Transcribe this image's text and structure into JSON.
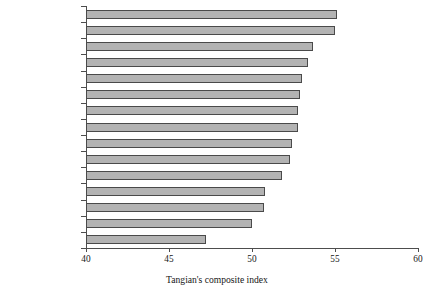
{
  "chart_data": {
    "type": "bar",
    "orientation": "horizontal",
    "title": "",
    "xlabel": "Tangian's composite index",
    "ylabel": "",
    "xlim": [
      40,
      60
    ],
    "xticks": [
      40,
      45,
      50,
      55,
      60
    ],
    "grid": false,
    "legend": null,
    "bar_color": "#b3b3b3",
    "bar_edge_color": "#4a4a4a",
    "categories": [
      "Netherlands",
      "Denmark",
      "Austria",
      "Sweden",
      "Germany",
      "Ireland",
      "Belgium",
      "Luxembourg",
      "Italy",
      "United Kingdom",
      "Finland",
      "France",
      "Portugal",
      "Spain",
      "Greece"
    ],
    "values": [
      55.1,
      55.0,
      53.7,
      53.4,
      53.0,
      52.9,
      52.8,
      52.8,
      52.4,
      52.3,
      51.8,
      50.8,
      50.7,
      50.0,
      47.2
    ]
  }
}
